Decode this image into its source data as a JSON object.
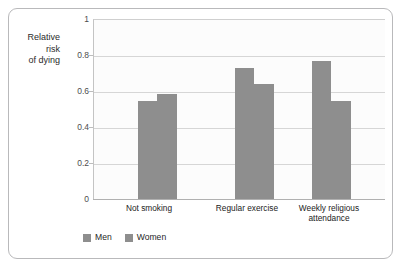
{
  "chart_data": {
    "type": "bar",
    "title": "",
    "subtitle": "",
    "xlabel": "",
    "ylabel": "Relative risk of dying",
    "ylabel_lines": [
      "Relative",
      "risk",
      "of dying"
    ],
    "categories": [
      "Not smoking",
      "Regular exercise",
      "Weekly religious attendance"
    ],
    "category_lines": [
      [
        "Not smoking"
      ],
      [
        "Regular exercise"
      ],
      [
        "Weekly religious",
        "attendance"
      ]
    ],
    "series": [
      {
        "name": "Men",
        "values": [
          0.545,
          0.73,
          0.77
        ],
        "color": "#8e8e8e"
      },
      {
        "name": "Women",
        "values": [
          0.585,
          0.645,
          0.545
        ],
        "color": "#8e8e8e"
      }
    ],
    "ylim": [
      0,
      1
    ],
    "yticks": [
      0,
      0.2,
      0.4,
      0.6,
      0.8,
      1
    ],
    "ytick_labels": [
      "0",
      "0.2",
      "0.4",
      "0.6",
      "0.8",
      "1"
    ],
    "grid": true,
    "grid_axis": "y",
    "legend": [
      "Men",
      "Women"
    ],
    "legend_position": "bottom-left"
  },
  "colors": {
    "bar": "#8e8e8e",
    "gridline": "#d6d6d6",
    "axis": "#b0b0b0",
    "frame": "#b9b9bb",
    "plot_background": "#fcfcfc",
    "text": "#222222"
  }
}
